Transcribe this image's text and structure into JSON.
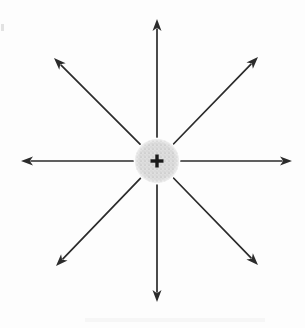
{
  "figure": {
    "background_color": "#fdfdfd",
    "canvas": {
      "width": 305,
      "height": 328
    }
  },
  "charge": {
    "label": "+",
    "polarity": "positive",
    "center": {
      "x": 157,
      "y": 161
    },
    "radius": 22,
    "fill_color": "#dcdcdc",
    "stipple_color": "#bdbdbd",
    "symbol_color": "#1a1a1a",
    "symbol_arm_length": 13,
    "symbol_stroke": 3.4
  },
  "field_lines": {
    "count": 8,
    "stroke_color": "#2b2b2b",
    "stroke_width": 1.7,
    "arrowhead_length": 12,
    "arrowhead_width": 9,
    "inner_radius": 24,
    "arrows": [
      {
        "name": "field-arrow-up",
        "direction": "up",
        "angle_deg": 90,
        "tip": {
          "x": 157,
          "y": 19
        }
      },
      {
        "name": "field-arrow-upper-right",
        "direction": "upper-right",
        "angle_deg": 45,
        "tip": {
          "x": 258,
          "y": 57
        }
      },
      {
        "name": "field-arrow-right",
        "direction": "right",
        "angle_deg": 0,
        "tip": {
          "x": 292,
          "y": 161
        }
      },
      {
        "name": "field-arrow-lower-right",
        "direction": "lower-right",
        "angle_deg": 315,
        "tip": {
          "x": 258,
          "y": 265
        }
      },
      {
        "name": "field-arrow-down",
        "direction": "down",
        "angle_deg": 270,
        "tip": {
          "x": 157,
          "y": 302
        }
      },
      {
        "name": "field-arrow-lower-left",
        "direction": "lower-left",
        "angle_deg": 225,
        "tip": {
          "x": 56,
          "y": 266
        }
      },
      {
        "name": "field-arrow-left",
        "direction": "left",
        "angle_deg": 180,
        "tip": {
          "x": 21,
          "y": 161
        }
      },
      {
        "name": "field-arrow-upper-left",
        "direction": "upper-left",
        "angle_deg": 135,
        "tip": {
          "x": 54,
          "y": 58
        }
      }
    ]
  },
  "artifacts": {
    "left_edge_mark": "scan-speck",
    "bottom_smudge": "scan-smudge"
  }
}
